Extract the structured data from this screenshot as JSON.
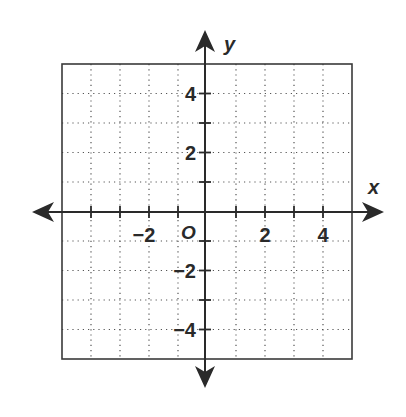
{
  "chart_data": {
    "type": "scatter",
    "title": "",
    "xlabel": "x",
    "ylabel": "y",
    "origin_label": "O",
    "xlim": [
      -5,
      5
    ],
    "ylim": [
      -5,
      5
    ],
    "grid": true,
    "grid_style": "dotted",
    "grid_step": 1,
    "x_tick_labels": [
      {
        "value": -2,
        "text": "−2"
      },
      {
        "value": 2,
        "text": "2"
      },
      {
        "value": 4,
        "text": "4"
      }
    ],
    "y_tick_labels": [
      {
        "value": 4,
        "text": "4"
      },
      {
        "value": 2,
        "text": "2"
      },
      {
        "value": -2,
        "text": "−2"
      },
      {
        "value": -4,
        "text": "−4"
      }
    ],
    "x_ticks": [
      -4,
      -3,
      -2,
      -1,
      1,
      2,
      3,
      4
    ],
    "y_ticks": [
      -4,
      -3,
      -2,
      -1,
      1,
      2,
      3,
      4
    ],
    "series": [],
    "legend": null
  },
  "colors": {
    "axis": "#2a2a2a",
    "grid": "#555555",
    "border": "#3a3a3a",
    "background": "#ffffff"
  }
}
